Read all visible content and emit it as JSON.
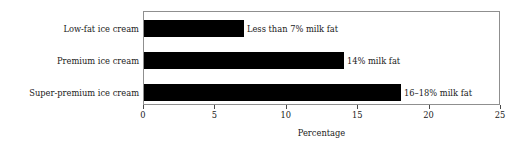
{
  "chart_data": {
    "type": "bar",
    "orientation": "horizontal",
    "title": "",
    "xlabel": "Percentage",
    "ylabel": "",
    "xlim": [
      0,
      25
    ],
    "xticks": [
      0,
      5,
      10,
      15,
      20,
      25
    ],
    "xtick_labels": [
      "0",
      "5",
      "10",
      "15",
      "20",
      "25"
    ],
    "grid": false,
    "legend": null,
    "bar_color": "#000000",
    "frame_color": "#8f8f8f",
    "background_color": "#ffffff",
    "categories": [
      "Low-fat ice cream",
      "Premium ice cream",
      "Super-premium ice cream"
    ],
    "values": [
      7,
      14,
      18
    ],
    "annotations": [
      "Less than 7% milk fat",
      "14% milk fat",
      "16–18% milk fat"
    ]
  },
  "axis": {
    "title": "Percentage"
  }
}
